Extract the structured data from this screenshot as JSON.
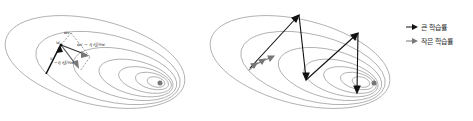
{
  "diagram": {
    "left_panel": {
      "title": "momentum vectors on loss contours",
      "labels": {
        "v": "v",
        "w": "w",
        "alpha_v": "αv",
        "neg_grad": "−η ∂J/∂w",
        "combined": "αv − η ∂J/∂w"
      }
    },
    "right_panel": {
      "title": "learning rate comparison trajectory"
    },
    "legend": [
      {
        "label": "큰 학습률",
        "color": "#111111"
      },
      {
        "label": "작은 학습률",
        "color": "#777777"
      }
    ]
  }
}
